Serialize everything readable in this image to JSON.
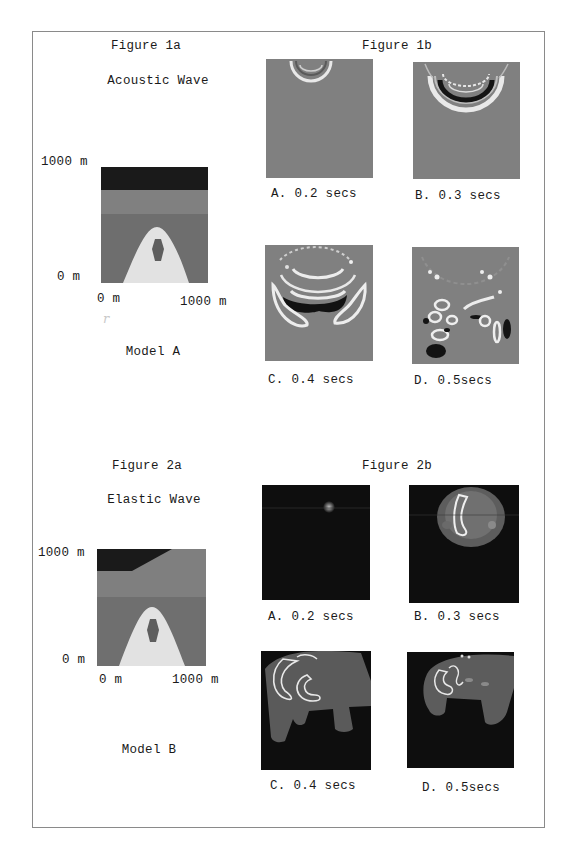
{
  "figure1a": {
    "title": "Figure 1a",
    "subtitle": "Acoustic Wave",
    "y_top_label": "1000 m",
    "y_bottom_label": "0 m",
    "x_left_label": "0 m",
    "x_right_label": "1000 m",
    "model_label": "Model A"
  },
  "figure1b": {
    "title": "Figure 1b",
    "panels": [
      {
        "label": "A. 0.2 secs"
      },
      {
        "label": "B. 0.3 secs"
      },
      {
        "label": "C. 0.4 secs"
      },
      {
        "label": "D. 0.5secs"
      }
    ]
  },
  "figure2a": {
    "title": "Figure 2a",
    "subtitle": "Elastic Wave",
    "y_top_label": "1000 m",
    "y_bottom_label": "0 m",
    "x_left_label": "0 m",
    "x_right_label": "1000 m",
    "model_label": "Model B"
  },
  "figure2b": {
    "title": "Figure 2b",
    "panels": [
      {
        "label": "A. 0.2 secs"
      },
      {
        "label": "B. 0.3 secs"
      },
      {
        "label": "C. 0.4 secs"
      },
      {
        "label": "D. 0.5secs"
      }
    ]
  },
  "colors": {
    "model_top_layer": "#1a1a1a",
    "model_mid_layer": "#7d7d7d",
    "model_lower_layer": "#6e6e6e",
    "model_dome": "#e2e2e2",
    "model_inclusion": "#5e5e5e",
    "acoustic_background": "#808080",
    "elastic_background": "#0e0e0e"
  }
}
